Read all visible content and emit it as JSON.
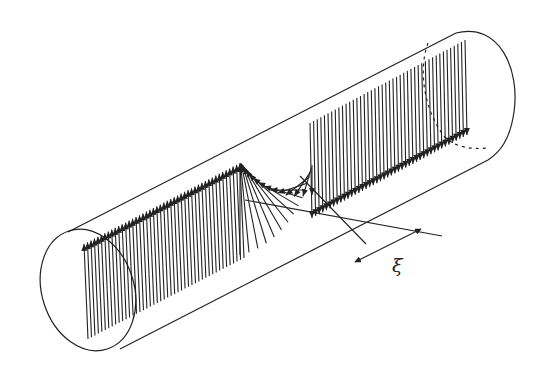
{
  "figure": {
    "label": "ξ",
    "colors": {
      "stroke": "#222222",
      "background": "#ffffff"
    },
    "cylinder": {
      "top_edge": [
        [
          68,
          232
        ],
        [
          456,
          33
        ]
      ],
      "bottom_edge": [
        [
          120,
          349
        ],
        [
          488,
          160
        ]
      ],
      "left_cap": {
        "cx": 88,
        "cy": 290,
        "rx": 46,
        "ry": 62,
        "rotate": -18
      },
      "right_cap_path": "M 456 33 C 500 22, 520 70, 514 112 C 510 140, 500 152, 488 160",
      "right_dashed_path": "M 428 43 C 418 70, 424 110, 444 136 C 452 146, 470 150, 488 148"
    },
    "left_segment": {
      "x_start": 88,
      "x_end": 244,
      "y_top_start": 244,
      "y_top_end": 163,
      "length": 95,
      "count": 46
    },
    "right_segment": {
      "x_start": 310,
      "x_end": 465,
      "y_bottom_start": 218,
      "y_bottom_end": 135,
      "length": 95,
      "count": 44
    },
    "twist": {
      "x_start": 240,
      "x_end": 312,
      "count": 16
    },
    "xi_marker": {
      "line_a": [
        [
          300,
          176
        ],
        [
          366,
          244
        ]
      ],
      "line_b": [
        [
          245,
          200
        ],
        [
          442,
          236
        ]
      ],
      "arrow": [
        [
          355,
          262
        ],
        [
          421,
          229
        ]
      ]
    }
  }
}
